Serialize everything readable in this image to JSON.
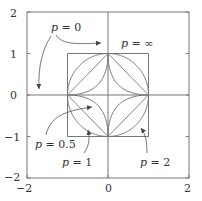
{
  "figure": {
    "x_ticks": [
      "−2",
      "0",
      "2"
    ],
    "x_tick_values": [
      -2,
      0,
      2
    ],
    "y_ticks": [
      "2",
      "1",
      "0",
      "−1",
      "−2"
    ],
    "y_tick_values": [
      2,
      1,
      0,
      -1,
      -2
    ],
    "xlim": [
      -2,
      2
    ],
    "ylim": [
      -2,
      2
    ],
    "line_color": "#777777",
    "text_color": "#333333",
    "curves": [
      {
        "p": "inf",
        "label_var": "p",
        "label_eq": " = ",
        "label_val": "∞"
      },
      {
        "p": 2,
        "label_var": "p",
        "label_eq": " = ",
        "label_val": "2"
      },
      {
        "p": 1,
        "label_var": "p",
        "label_eq": " = ",
        "label_val": "1"
      },
      {
        "p": 0.5,
        "label_var": "p",
        "label_eq": " = ",
        "label_val": "0.5"
      },
      {
        "p": 0,
        "label_var": "p",
        "label_eq": " = ",
        "label_val": "0"
      }
    ]
  }
}
